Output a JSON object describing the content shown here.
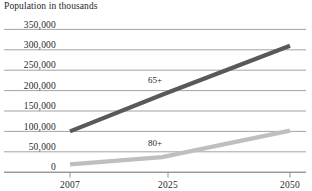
{
  "chart_data": {
    "type": "line",
    "title": "Population in thousands",
    "xlabel": "",
    "ylabel": "",
    "x": [
      2007,
      2025,
      2050
    ],
    "categories": [
      "2007",
      "2025",
      "2050"
    ],
    "xlim": [
      2007,
      2050
    ],
    "ylim": [
      0,
      350000
    ],
    "ytick_labels": [
      "350,000",
      "300,000",
      "250,000",
      "200,000",
      "150,000",
      "100,000",
      "50,000",
      "0"
    ],
    "ytick_values": [
      350000,
      300000,
      250000,
      200000,
      150000,
      100000,
      50000,
      0
    ],
    "xtick_labels": [
      "2007",
      "2025",
      "2050"
    ],
    "grid": true,
    "legend_position": "inline-annotation",
    "series": [
      {
        "name": "65+",
        "label": "65+",
        "color": "#595959",
        "values": [
          100000,
          190000,
          310000
        ]
      },
      {
        "name": "80+",
        "label": "80+",
        "color": "#bfbfbf",
        "values": [
          19000,
          37000,
          102000
        ]
      }
    ]
  },
  "annotations": {
    "series_65_label": "65+",
    "series_80_label": "80+"
  },
  "colors": {
    "gridline": "#8c8c8c",
    "axis": "#595959",
    "text": "#1f1f1f",
    "series_65": "#595959",
    "series_80": "#bfbfbf"
  }
}
